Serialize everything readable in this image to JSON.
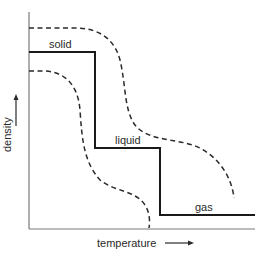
{
  "diagram": {
    "type": "phase-density-temperature",
    "labels": {
      "solid": "solid",
      "liquid": "liquid",
      "gas": "gas"
    },
    "axes": {
      "x_label": "temperature",
      "y_label": "density",
      "x_arrow": "right-arrow",
      "y_arrow": "up-arrow"
    },
    "curves": {
      "main_step": {
        "style": "solid",
        "color": "#1a1a1a",
        "points": [
          [
            29,
            52
          ],
          [
            95,
            52
          ],
          [
            95,
            148
          ],
          [
            160,
            148
          ],
          [
            160,
            215
          ],
          [
            255,
            215
          ]
        ]
      },
      "upper_bound": {
        "style": "dashed",
        "color": "#2a2a2a"
      },
      "lower_bound": {
        "style": "dashed",
        "color": "#2a2a2a"
      }
    },
    "colors": {
      "axis": "#7a7a7a",
      "line": "#1a1a1a",
      "dashed": "#2a2a2a",
      "text": "#2a2a2a",
      "background": "#ffffff"
    }
  }
}
